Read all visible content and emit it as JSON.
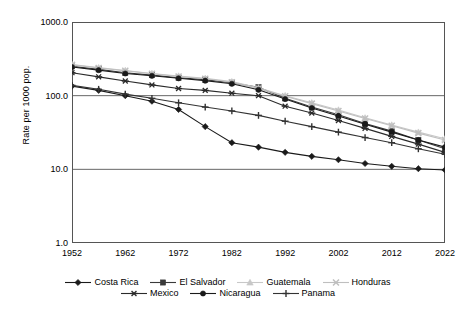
{
  "chart_data": {
    "type": "line",
    "title": "",
    "xlabel": "",
    "ylabel": "Rate per 1000 pop.",
    "yscale": "log",
    "ylim": [
      1.0,
      1000.0
    ],
    "ytick_labels": [
      "1000.0",
      "100.0",
      "10.0",
      "1.0"
    ],
    "ytick_values": [
      1000.0,
      100.0,
      10.0,
      1.0
    ],
    "xlim": [
      1952,
      2022
    ],
    "xtick_labels": [
      "1952",
      "1962",
      "1972",
      "1982",
      "1992",
      "2002",
      "2012",
      "2022"
    ],
    "xtick_values": [
      1952,
      1962,
      1972,
      1982,
      1992,
      2002,
      2012,
      2022
    ],
    "x": [
      1952,
      1957,
      1962,
      1967,
      1972,
      1977,
      1982,
      1987,
      1992,
      1997,
      2002,
      2007,
      2012,
      2017,
      2022
    ],
    "grid": true,
    "legend_position": "bottom",
    "series": [
      {
        "name": "Costa Rica",
        "marker": "diamond",
        "color": "#1a1a1a",
        "values": [
          135,
          118,
          100,
          84,
          65,
          38,
          23,
          20,
          17,
          15,
          13.5,
          12,
          11,
          10.2,
          9.8
        ]
      },
      {
        "name": "El Salvador",
        "marker": "square",
        "color": "#3a3a3a",
        "values": [
          250,
          228,
          205,
          190,
          175,
          165,
          150,
          130,
          92,
          70,
          55,
          42,
          33,
          25,
          19
        ]
      },
      {
        "name": "Guatemala",
        "marker": "triangle",
        "color": "#c8c8c8",
        "values": [
          265,
          240,
          220,
          200,
          185,
          172,
          155,
          128,
          100,
          80,
          64,
          50,
          40,
          32,
          26
        ]
      },
      {
        "name": "Honduras",
        "marker": "x",
        "color": "#bfbfbf",
        "values": [
          262,
          238,
          218,
          198,
          182,
          170,
          152,
          125,
          98,
          78,
          62,
          49,
          39,
          31,
          25
        ]
      },
      {
        "name": "Mexico",
        "marker": "asterisk",
        "color": "#2a2a2a",
        "values": [
          205,
          180,
          158,
          140,
          125,
          118,
          108,
          100,
          72,
          58,
          46,
          36,
          28,
          22,
          17
        ]
      },
      {
        "name": "Nicaragua",
        "marker": "circle",
        "color": "#1a1a1a",
        "values": [
          245,
          222,
          200,
          186,
          172,
          160,
          145,
          120,
          90,
          68,
          53,
          41,
          32,
          25,
          20
        ]
      },
      {
        "name": "Panama",
        "marker": "plus",
        "color": "#333333",
        "values": [
          138,
          122,
          105,
          92,
          80,
          70,
          62,
          54,
          45,
          38,
          32,
          27,
          23,
          19,
          16
        ]
      }
    ]
  },
  "legend": {
    "row1": [
      "Costa Rica",
      "El Salvador",
      "Guatemala",
      "Honduras"
    ],
    "row2": [
      "Mexico",
      "Nicaragua",
      "Panama"
    ]
  }
}
